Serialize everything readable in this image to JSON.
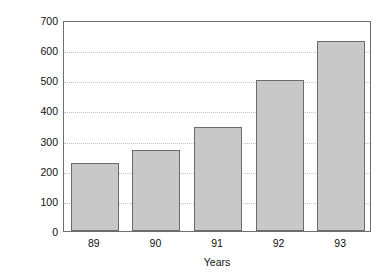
{
  "chart_data": {
    "type": "bar",
    "title": "",
    "categories": [
      "89",
      "90",
      "91",
      "92",
      "93"
    ],
    "values": [
      225,
      268,
      345,
      500,
      630
    ],
    "series": [
      {
        "name": "Revenue",
        "values": [
          225,
          268,
          345,
          500,
          630
        ]
      }
    ],
    "xlabel": "Years",
    "ylabel": "$ Millions",
    "ylim": [
      0,
      700
    ],
    "ytick_labels": [
      "700",
      "600",
      "500",
      "400",
      "300",
      "200",
      "100",
      "0"
    ],
    "ytick_values": [
      700,
      600,
      500,
      400,
      300,
      200,
      100,
      0
    ],
    "grid": true,
    "grid_axis": "y",
    "legend": false,
    "bar_fill_color": "#c8c8c8",
    "bar_border_color": "#6b6b6b",
    "gridline_color": "#c4c4c4",
    "axis_color": "#6e6e6e",
    "text_color": "#111111"
  }
}
